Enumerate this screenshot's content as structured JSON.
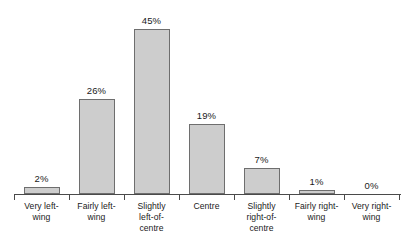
{
  "chart_data": {
    "type": "bar",
    "title": "",
    "subtitle": "",
    "xlabel": "",
    "ylabel": "",
    "categories": [
      "Very left-wing",
      "Fairly left-wing",
      "Slightly left-of-centre",
      "Centre",
      "Slightly right-of-centre",
      "Fairly right-wing",
      "Very right-wing"
    ],
    "category_lines": [
      [
        "Very left-",
        "wing"
      ],
      [
        "Fairly left-",
        "wing"
      ],
      [
        "Slightly",
        "left-of-",
        "centre"
      ],
      [
        "Centre"
      ],
      [
        "Slightly",
        "right-of-",
        "centre"
      ],
      [
        "Fairly right-",
        "wing"
      ],
      [
        "Very right-",
        "wing"
      ]
    ],
    "values": [
      2,
      26,
      45,
      19,
      7,
      1,
      0
    ],
    "value_labels": [
      "2%",
      "26%",
      "45%",
      "19%",
      "7%",
      "1%",
      "0%"
    ],
    "ylim": [
      0,
      45
    ],
    "grid": false,
    "legend": null,
    "bar_color": "#cdcdcd",
    "bar_border_color": "#6e6e6e",
    "axis_color": "#4a4a4a",
    "background_color": "#ffffff"
  }
}
